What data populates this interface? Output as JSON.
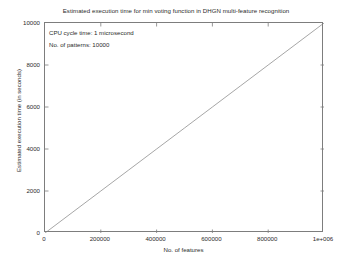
{
  "figure": {
    "width": 352,
    "height": 263,
    "background_color": "#ffffff",
    "axis_color": "#7d7d7d",
    "text_color": "#2b2b2b"
  },
  "annotations": [
    "CPU cycle time: 1 microsecond",
    "No. of patterns: 10000"
  ],
  "chart_data": {
    "type": "line",
    "title": "Estimated execution time for min voting function in DHGN multi-feature recognition",
    "xlabel": "No. of features",
    "ylabel": "Estimated execution time (in seconds)",
    "xlim": [
      0,
      1000000
    ],
    "ylim": [
      0,
      10000
    ],
    "grid": false,
    "legend": null,
    "box": true,
    "tick_direction": "in",
    "line_color": "#808080",
    "line_width": 0.7,
    "xticks": [
      0,
      200000,
      400000,
      600000,
      800000,
      1000000
    ],
    "xticklabels": [
      "0",
      "200000",
      "400000",
      "600000",
      "800000",
      "1e+006"
    ],
    "yticks": [
      0,
      2000,
      4000,
      6000,
      8000,
      10000
    ],
    "yticklabels": [
      "0",
      "2000",
      "4000",
      "6000",
      "8000",
      "10000"
    ],
    "series": [
      {
        "name": "min voting execution time",
        "x": [
          0,
          100000,
          200000,
          300000,
          400000,
          500000,
          600000,
          700000,
          800000,
          900000,
          1000000
        ],
        "values": [
          0,
          1000,
          2000,
          3000,
          4000,
          5000,
          6000,
          7000,
          8000,
          9000,
          10000
        ]
      }
    ],
    "annotations": [
      "CPU cycle time: 1 microsecond",
      "No. of patterns: 10000"
    ]
  }
}
